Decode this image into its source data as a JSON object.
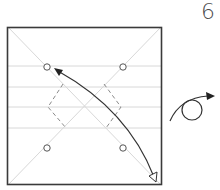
{
  "step": {
    "number": "6"
  },
  "diagram": {
    "colors": {
      "outline": "#3a3a3a",
      "crease": "#d6d6d6",
      "dashed": "#8a8a8a",
      "arrow": "#333333"
    },
    "symbols": [
      "fold-arrow",
      "turn-over-arrow",
      "reference-circles",
      "valley-fold-dashes"
    ]
  }
}
